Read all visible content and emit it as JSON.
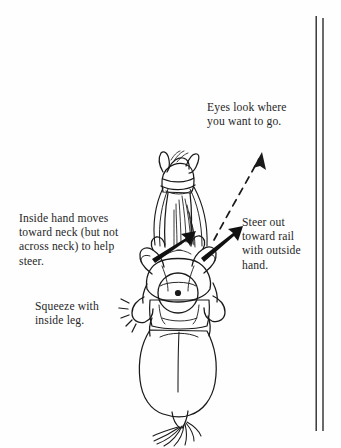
{
  "page": {
    "kind": "instructional-line-drawing",
    "background_color": "#fefefe",
    "ink_color": "#1a1a1a",
    "width": 341,
    "height": 448
  },
  "captions": {
    "eyes": "Eyes look where\nyou want to go.",
    "inside_hand": "Inside hand moves\ntoward neck (but not\nacross neck) to help\nsteer.",
    "steer_out": "Steer out\ntoward rail\nwith outside\nhand.",
    "squeeze": "Squeeze with\ninside leg."
  },
  "figure": {
    "parts": [
      "horse-head",
      "horse-ears",
      "bridle",
      "horse-neck",
      "horse-mane",
      "rider-head",
      "rider-shoulders",
      "rider-left-arm",
      "rider-right-arm",
      "saddle",
      "horse-barrel",
      "horse-hindquarters",
      "horse-tail"
    ]
  },
  "arrows": {
    "eyes_direction": {
      "style": "dashed",
      "label_ref": "eyes",
      "from": [
        216,
        238
      ],
      "to": [
        262,
        154
      ]
    },
    "inside_hand": {
      "style": "solid-black",
      "label_ref": "inside_hand",
      "from": [
        158,
        254
      ],
      "to": [
        192,
        232
      ]
    },
    "outside_hand": {
      "style": "solid-black",
      "label_ref": "steer_out",
      "from": [
        205,
        253
      ],
      "to": [
        238,
        228
      ]
    }
  },
  "rail": {
    "name": "arena-rail",
    "orientation": "vertical",
    "line_count": 2,
    "x_positions": [
      316,
      323
    ],
    "top": 16,
    "bottom": 431
  },
  "motion_marks": {
    "name": "squeeze-motion-lines",
    "count": 5,
    "location": "rider-inside-leg"
  }
}
